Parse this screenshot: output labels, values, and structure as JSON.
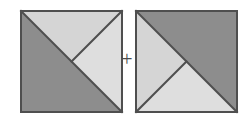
{
  "figure": {
    "title": "",
    "operator_label": "+",
    "background_color": "#ffffff",
    "stroke_color": "#4f4f4f",
    "stroke_width": 2,
    "canvas": {
      "width": 247,
      "height": 120
    },
    "shapes": [
      {
        "name": "left-square",
        "label": "Left square",
        "x": 21,
        "y": 11,
        "size": 101,
        "regions": [
          {
            "name": "left-square-lower-left-triangle",
            "label": "Lower-left large triangle",
            "fill": "#8d8d8d",
            "points": "0,0 0,101 101,101"
          },
          {
            "name": "left-square-top-triangle",
            "label": "Top triangle",
            "fill": "#d5d5d5",
            "points": "0,0 101,0 50.5,50.5"
          },
          {
            "name": "left-square-right-triangle",
            "label": "Right triangle",
            "fill": "#dedede",
            "points": "101,0 101,101 50.5,50.5"
          }
        ],
        "edges": [
          {
            "name": "left-square-main-diagonal",
            "x1": 0,
            "y1": 0,
            "x2": 101,
            "y2": 101
          },
          {
            "name": "left-square-center-to-top-right",
            "x1": 101,
            "y1": 0,
            "x2": 50.5,
            "y2": 50.5
          }
        ]
      },
      {
        "name": "right-square",
        "label": "Right square",
        "x": 136,
        "y": 11,
        "size": 101,
        "regions": [
          {
            "name": "right-square-upper-right-triangle",
            "label": "Upper-right large triangle",
            "fill": "#8d8d8d",
            "points": "0,0 101,0 101,101"
          },
          {
            "name": "right-square-left-triangle",
            "label": "Left triangle",
            "fill": "#d5d5d5",
            "points": "0,0 0,101 50.5,50.5"
          },
          {
            "name": "right-square-bottom-triangle",
            "label": "Bottom triangle",
            "fill": "#dedede",
            "points": "0,101 101,101 50.5,50.5"
          }
        ],
        "edges": [
          {
            "name": "right-square-main-diagonal",
            "x1": 0,
            "y1": 0,
            "x2": 101,
            "y2": 101
          },
          {
            "name": "right-square-center-to-bottom-left",
            "x1": 0,
            "y1": 101,
            "x2": 50.5,
            "y2": 50.5
          }
        ]
      }
    ]
  }
}
